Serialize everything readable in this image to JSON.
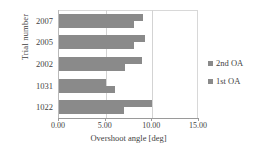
{
  "chart_data": {
    "type": "bar",
    "orientation": "horizontal",
    "title": "",
    "xlabel": "Overshoot angle [deg]",
    "ylabel": "Trial number",
    "xlim": [
      0.0,
      15.0
    ],
    "xticks": [
      "0.00",
      "5.00",
      "10.00",
      "15.00"
    ],
    "xtick_values": [
      0.0,
      5.0,
      10.0,
      15.0
    ],
    "grid": "vertical",
    "legend_position": "right",
    "categories": [
      "2007",
      "2005",
      "2002",
      "1031",
      "1022"
    ],
    "series": [
      {
        "name": "2nd OA",
        "color": "#8a8a8a",
        "values": [
          9.0,
          9.2,
          8.9,
          5.0,
          10.0
        ]
      },
      {
        "name": "1st OA",
        "color": "#8a8a8a",
        "values": [
          8.0,
          8.0,
          7.1,
          6.0,
          7.0
        ]
      }
    ]
  },
  "colors": {
    "bar": "#8a8a8a",
    "gridline": "#d3d3d3",
    "axis": "#9a9a9a",
    "text": "#3f3f3f",
    "background": "#ffffff"
  },
  "legend": {
    "items": [
      {
        "label": "2nd OA"
      },
      {
        "label": "1st OA"
      }
    ]
  }
}
